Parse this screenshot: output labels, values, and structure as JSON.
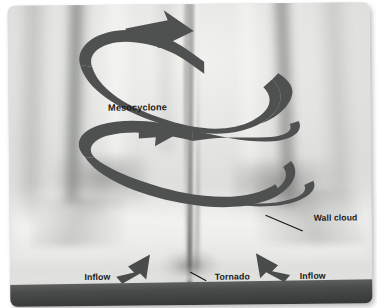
{
  "figure": {
    "kind": "annotated-photograph",
    "palette": {
      "arrow_ribbon": "#4f5150",
      "inflow_arrow": "#4a4c4b",
      "label_text": "#1b1b1b",
      "ground": "#3d3f3f",
      "sky": "#e9eae7",
      "page_background": "#ffffff"
    }
  },
  "labels": {
    "mesocyclone": "Mesocyclone",
    "wall_cloud": "Wall cloud",
    "tornado": "Tornado",
    "inflow_left": "Inflow",
    "inflow_right": "Inflow"
  },
  "annotations": {
    "rotation_ribbon": {
      "name": "mesocyclone-rotation-arrow",
      "description": "Wide dark ribbon spiralling counter-clockwise upward around the storm, with two arrowheads pointing right",
      "arrowhead_count": 2,
      "direction": "cyclonic-upward"
    },
    "leader_lines": [
      {
        "for": "wall_cloud",
        "from": "label",
        "to": "right wall cloud base"
      },
      {
        "for": "tornado",
        "from": "label",
        "to": "tornado funnel base"
      }
    ],
    "inflow_arrows": [
      {
        "side": "left",
        "points": "up-right"
      },
      {
        "side": "right",
        "points": "up-left"
      }
    ]
  }
}
